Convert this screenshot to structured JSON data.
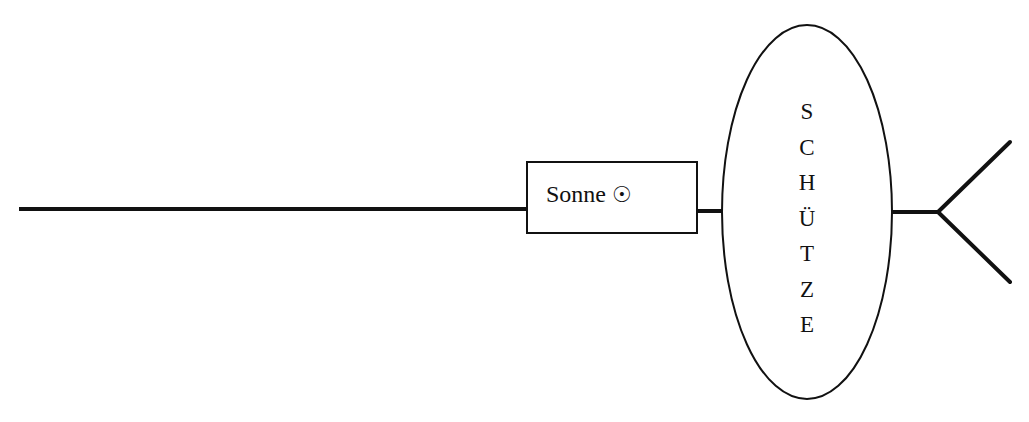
{
  "diagram": {
    "box": {
      "label": "Sonne",
      "symbol": "☉",
      "symbol_name": "sun-symbol"
    },
    "ellipse": {
      "letters": [
        "S",
        "C",
        "H",
        "Ü",
        "T",
        "Z",
        "E"
      ],
      "word": "SCHÜTZE"
    },
    "colors": {
      "stroke": "#111111",
      "background": "#ffffff"
    }
  }
}
